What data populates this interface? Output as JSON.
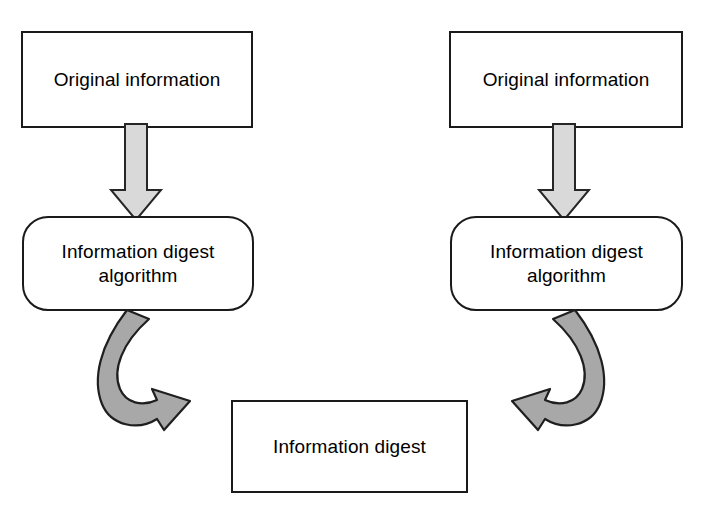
{
  "diagram": {
    "background_color": "#ffffff",
    "nodes": {
      "source_left": {
        "label": "Original information",
        "shape": "rectangle",
        "fill": "#ffffff",
        "border_color": "#1a1a1a"
      },
      "algorithm_left": {
        "label": "Information digest\nalgorithm",
        "shape": "rounded-rectangle",
        "fill": "#ffffff",
        "border_color": "#1a1a1a"
      },
      "source_right": {
        "label": "Original information",
        "shape": "rectangle",
        "fill": "#ffffff",
        "border_color": "#1a1a1a"
      },
      "algorithm_right": {
        "label": "Information digest\nalgorithm",
        "shape": "rounded-rectangle",
        "fill": "#ffffff",
        "border_color": "#1a1a1a"
      },
      "digest": {
        "label": "Information digest",
        "shape": "rectangle",
        "fill": "#ffffff",
        "border_color": "#1a1a1a"
      }
    },
    "connectors": {
      "down_left": {
        "type": "block-arrow",
        "direction": "down",
        "fill": "#d9d9d9",
        "stroke": "#262626",
        "from": "source_left",
        "to": "algorithm_left"
      },
      "down_right": {
        "type": "block-arrow",
        "direction": "down",
        "fill": "#d9d9d9",
        "stroke": "#262626",
        "from": "source_right",
        "to": "algorithm_right"
      },
      "curve_left": {
        "type": "curved-arrow",
        "direction": "down-right",
        "fill": "#a8a8a8",
        "stroke": "#1f1f1f",
        "from": "algorithm_left",
        "to": "digest"
      },
      "curve_right": {
        "type": "curved-arrow",
        "direction": "down-left",
        "fill": "#a8a8a8",
        "stroke": "#1f1f1f",
        "from": "algorithm_right",
        "to": "digest"
      }
    }
  }
}
